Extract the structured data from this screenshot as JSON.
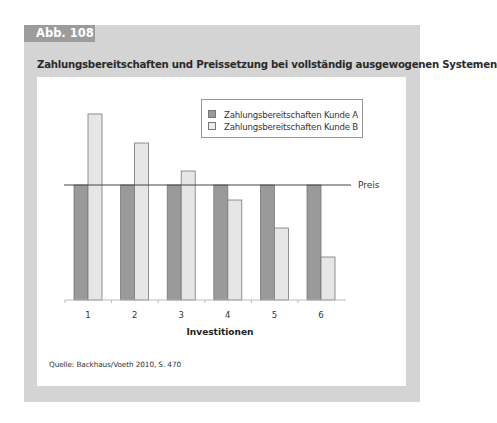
{
  "figure": {
    "tag": "Abb. 108",
    "title": "Zahlungsbereitschaften und Preissetzung bei vollständig ausgewogenen Systemen",
    "source": "Quelle: Backhaus/Voeth 2010, S. 470"
  },
  "colors": {
    "panel_bg": "#d4d4d4",
    "tag_bg": "#9c9c9c",
    "series_a": "#9a9a9a",
    "series_b": "#e6e6e6",
    "bar_stroke": "#777777",
    "price_line": "#444444"
  },
  "chart_data": {
    "type": "bar",
    "title": "Zahlungsbereitschaften und Preissetzung bei vollständig ausgewogenen Systemen",
    "xlabel": "Investitionen",
    "ylabel": "",
    "categories": [
      "1",
      "2",
      "3",
      "4",
      "5",
      "6"
    ],
    "series": [
      {
        "name": "Zahlungsbereitschaften Kunde A",
        "values": [
          115,
          115,
          115,
          115,
          115,
          115
        ]
      },
      {
        "name": "Zahlungsbereitschaften Kunde B",
        "values": [
          186,
          157,
          129,
          100,
          72,
          43
        ]
      }
    ],
    "reference_lines": [
      {
        "label": "Preis",
        "value": 115
      }
    ],
    "ylim": [
      0,
      190
    ],
    "y_axis_visible": false,
    "grid": false,
    "legend_position": "top-right",
    "note": "Values are relative bar heights in pixels above the baseline (no numeric y-axis shown)."
  },
  "legend": {
    "items": [
      {
        "label": "Zahlungsbereitschaften Kunde A"
      },
      {
        "label": "Zahlungsbereitschaften Kunde B"
      }
    ]
  },
  "reference": {
    "label": "Preis"
  }
}
